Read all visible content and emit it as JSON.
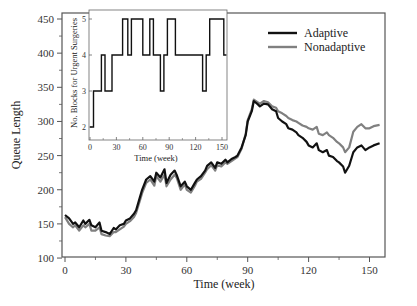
{
  "chart_data": [
    {
      "type": "line",
      "title": "",
      "xlabel": "Time (week)",
      "ylabel": "Queue Length",
      "xlim": [
        0,
        158
      ],
      "ylim": [
        100,
        450
      ],
      "xticks": [
        0,
        30,
        60,
        90,
        120,
        150
      ],
      "yticks": [
        100,
        150,
        200,
        250,
        300,
        350,
        400,
        450
      ],
      "grid": false,
      "legend_position": "upper right",
      "series": [
        {
          "name": "Adaptive",
          "color": "#111111",
          "x": [
            0,
            2,
            4,
            5,
            7,
            9,
            10,
            12,
            13,
            15,
            17,
            18,
            20,
            22,
            24,
            25,
            27,
            29,
            30,
            32,
            34,
            35,
            37,
            38,
            40,
            42,
            44,
            45,
            47,
            49,
            50,
            52,
            54,
            55,
            57,
            59,
            60,
            62,
            64,
            65,
            67,
            69,
            70,
            72,
            74,
            75,
            77,
            79,
            80,
            82,
            84,
            85,
            87,
            89,
            90,
            92,
            93,
            95,
            96,
            98,
            100,
            102,
            104,
            105,
            107,
            109,
            110,
            112,
            114,
            115,
            117,
            119,
            120,
            122,
            124,
            125,
            127,
            129,
            130,
            132,
            134,
            135,
            137,
            138,
            140,
            142,
            144,
            146,
            148,
            150,
            152,
            155
          ],
          "values": [
            163,
            158,
            150,
            152,
            145,
            155,
            150,
            156,
            148,
            145,
            152,
            140,
            138,
            135,
            144,
            142,
            148,
            150,
            155,
            158,
            165,
            170,
            190,
            200,
            215,
            220,
            212,
            225,
            218,
            230,
            210,
            222,
            228,
            222,
            205,
            212,
            205,
            200,
            210,
            215,
            220,
            228,
            235,
            240,
            232,
            240,
            238,
            244,
            240,
            245,
            248,
            250,
            262,
            280,
            300,
            315,
            330,
            325,
            322,
            326,
            325,
            318,
            315,
            305,
            300,
            296,
            290,
            288,
            284,
            280,
            276,
            270,
            265,
            262,
            268,
            258,
            255,
            258,
            250,
            248,
            242,
            240,
            234,
            225,
            235,
            255,
            262,
            265,
            258,
            262,
            265,
            268
          ]
        },
        {
          "name": "Nonadaptive",
          "color": "#808080",
          "x": [
            0,
            2,
            4,
            5,
            7,
            9,
            10,
            12,
            13,
            15,
            17,
            18,
            20,
            22,
            24,
            25,
            27,
            29,
            30,
            32,
            34,
            35,
            37,
            38,
            40,
            42,
            44,
            45,
            47,
            49,
            50,
            52,
            54,
            55,
            57,
            59,
            60,
            62,
            64,
            65,
            67,
            69,
            70,
            72,
            74,
            75,
            77,
            79,
            80,
            82,
            84,
            85,
            87,
            89,
            90,
            92,
            93,
            95,
            96,
            98,
            100,
            102,
            104,
            105,
            107,
            109,
            110,
            112,
            114,
            115,
            117,
            119,
            120,
            122,
            124,
            125,
            127,
            129,
            130,
            132,
            134,
            135,
            137,
            138,
            140,
            142,
            144,
            146,
            148,
            150,
            152,
            155
          ],
          "values": [
            160,
            150,
            145,
            148,
            140,
            148,
            145,
            150,
            140,
            140,
            145,
            135,
            133,
            132,
            138,
            138,
            142,
            146,
            150,
            154,
            160,
            166,
            185,
            195,
            210,
            215,
            206,
            220,
            212,
            222,
            205,
            215,
            222,
            218,
            200,
            208,
            200,
            196,
            206,
            212,
            216,
            225,
            230,
            236,
            228,
            236,
            234,
            240,
            238,
            242,
            246,
            248,
            260,
            282,
            302,
            318,
            332,
            328,
            326,
            330,
            328,
            322,
            320,
            315,
            312,
            308,
            305,
            302,
            300,
            298,
            294,
            292,
            290,
            288,
            292,
            282,
            280,
            284,
            280,
            276,
            270,
            268,
            262,
            255,
            262,
            285,
            292,
            296,
            290,
            290,
            293,
            295
          ]
        }
      ]
    },
    {
      "type": "line",
      "step": true,
      "title": "",
      "xlabel": "Time (week)",
      "ylabel": "No. Blocks for Urgent Surgeries",
      "xlim": [
        0,
        155
      ],
      "ylim": [
        2,
        5
      ],
      "xticks": [
        0,
        30,
        60,
        90,
        120,
        150
      ],
      "yticks": [
        2,
        3,
        4,
        5
      ],
      "grid": false,
      "series": [
        {
          "name": "Blocks",
          "color": "#111111",
          "x": [
            0,
            4,
            4,
            13,
            13,
            17,
            17,
            25,
            25,
            37,
            37,
            43,
            43,
            47,
            47,
            60,
            60,
            68,
            68,
            72,
            72,
            80,
            80,
            84,
            84,
            88,
            88,
            97,
            97,
            128,
            128,
            132,
            132,
            136,
            136,
            152,
            152,
            155
          ],
          "values": [
            2,
            2,
            3,
            3,
            4,
            4,
            3,
            3,
            4,
            4,
            5,
            5,
            4,
            4,
            5,
            5,
            4,
            4,
            5,
            5,
            4,
            4,
            3,
            3,
            4,
            4,
            5,
            5,
            4,
            4,
            3,
            3,
            4,
            4,
            5,
            5,
            4,
            4
          ]
        }
      ]
    }
  ],
  "main": {
    "xlabel": "Time (week)",
    "ylabel": "Queue Length",
    "xticks": [
      "0",
      "30",
      "60",
      "90",
      "120",
      "150"
    ],
    "yticks": [
      "100",
      "150",
      "200",
      "250",
      "300",
      "350",
      "400",
      "450"
    ]
  },
  "inset": {
    "xlabel": "Time (week)",
    "ylabel": "No. Blocks for Urgent Surgeries",
    "xticks": [
      "0",
      "30",
      "60",
      "90",
      "120",
      "150"
    ],
    "yticks": [
      "2",
      "3",
      "4",
      "5"
    ]
  },
  "legend": [
    {
      "label": "Adaptive",
      "color": "#111111"
    },
    {
      "label": "Nonadaptive",
      "color": "#808080"
    }
  ]
}
